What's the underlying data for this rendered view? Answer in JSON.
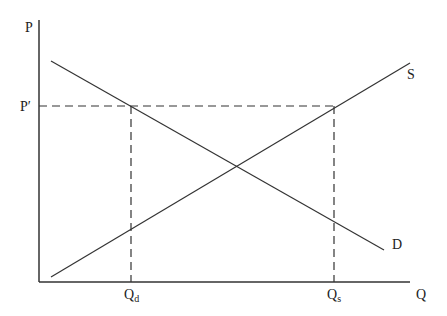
{
  "diagram": {
    "axes": {
      "y_label": "P",
      "x_label": "Q"
    },
    "price_level": {
      "label": "P′"
    },
    "curves": [
      {
        "name": "supply",
        "label": "S"
      },
      {
        "name": "demand",
        "label": "D"
      }
    ],
    "quantities": [
      {
        "name": "quantity-demanded",
        "base": "Q",
        "sub": "d"
      },
      {
        "name": "quantity-supplied",
        "base": "Q",
        "sub": "s"
      }
    ],
    "colors": {
      "line": "#333333",
      "background": "#ffffff"
    }
  }
}
